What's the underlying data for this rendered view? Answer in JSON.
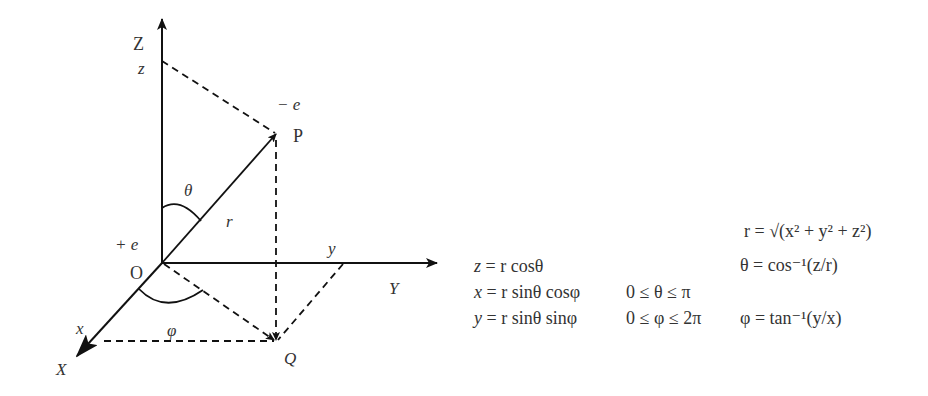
{
  "diagram": {
    "colors": {
      "line": "#111111",
      "text": "#333333",
      "background": "#ffffff"
    },
    "axes": {
      "z_axis_label": "Z",
      "y_axis_label": "Y",
      "x_axis_label": "X"
    },
    "points": {
      "origin_label": "O",
      "point_p_label": "P",
      "point_q_label": "Q",
      "z_projection_label": "z",
      "y_projection_label": "y",
      "x_projection_label": "x"
    },
    "charges": {
      "positive": "+ e",
      "negative": "− e"
    },
    "quantities": {
      "radius_label": "r",
      "theta_label": "θ",
      "phi_label": "φ"
    }
  },
  "formulas": {
    "conversions": [
      {
        "lhs": "z",
        "rhs": "r cosθ"
      },
      {
        "lhs": "x",
        "rhs": "r sinθ cosφ"
      },
      {
        "lhs": "y",
        "rhs": "r sinθ sinφ"
      }
    ],
    "ranges": [
      "0 ≤ θ ≤ π",
      "0 ≤ φ ≤ 2π"
    ],
    "inverse": [
      "r = √(x² + y² + z²)",
      "θ = cos⁻¹(z/r)",
      "φ = tan⁻¹(y/x)"
    ]
  }
}
